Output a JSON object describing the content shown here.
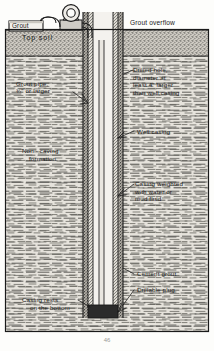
{
  "figure": {
    "caption": "46",
    "colors": {
      "ink": "#1a1a1a",
      "paper": "#fdfdfb",
      "topsoil": "#b9b5ad",
      "formation": "#d9d6cf",
      "grout_annulus": "#8f8c86",
      "plug": "#2b2b2b",
      "pump": "#cfccc6"
    }
  },
  "labels": {
    "grout_tank": "Grout",
    "top_soil": "Top soil",
    "grout_overflow": "Grout overflow",
    "grout_pipe_l1": "Grout pipe,",
    "grout_pipe_l2": "¾\" or larger",
    "drilled_hole_l1": "Drilled hole,",
    "drilled_hole_l2": "diameter at",
    "drilled_hole_l3": "least 4\" larger",
    "drilled_hole_l4": "than well casing",
    "non_caving_l1": "Non - caving",
    "non_caving_l2": "formation",
    "well_casing": "Well casing",
    "casing_weighted_l1": "Casing weighted",
    "casing_weighted_l2": "with water or",
    "casing_weighted_l3": "mud fluid",
    "cement_grout": "Cement grout",
    "drillable_plug": "Drillable plug",
    "casing_rests_l1": "Casing rests",
    "casing_rests_l2": "on the bottom"
  },
  "icons": {
    "pump": "pump-icon",
    "hose_left": "hose-left-icon",
    "hose_right": "hose-right-icon",
    "leader_grout_pipe": "leader-line-icon",
    "leader_well_casing": "leader-line-icon",
    "leader_casing_weighted": "leader-line-icon",
    "leader_cement_grout": "leader-line-icon",
    "leader_drillable_plug": "leader-line-icon",
    "leader_casing_rests": "leader-line-icon",
    "leader_drilled_hole": "leader-line-icon"
  },
  "geometry": {
    "frame": {
      "x": 5,
      "y": 29,
      "w": 204,
      "h": 303
    },
    "topsoil_band": {
      "y": 30,
      "h": 26
    },
    "borehole": {
      "x": 82,
      "w": 42,
      "top": 12,
      "bottom": 318
    },
    "casing": {
      "x": 92,
      "w": 22
    },
    "plug": {
      "y": 305,
      "h": 13
    }
  }
}
